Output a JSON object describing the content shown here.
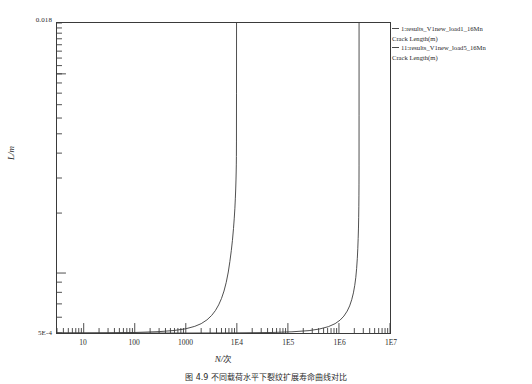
{
  "chart_data": {
    "type": "line",
    "title": "",
    "xlabel": "N/次",
    "ylabel": "L/m",
    "xscale": "log",
    "yscale": "log",
    "xlim": [
      3,
      10000000
    ],
    "ylim": [
      0.0005,
      0.018
    ],
    "grid": false,
    "legend_position": "right",
    "xtick_labels": [
      "10",
      "100",
      "1000",
      "1E4",
      "1E5",
      "1E6",
      "1E7"
    ],
    "xtick_values": [
      10,
      100,
      1000,
      10000,
      100000,
      1000000,
      10000000
    ],
    "ytick_labels": [
      "0.018",
      "5E-4"
    ],
    "ytick_values": [
      0.018,
      0.0005
    ],
    "series": [
      {
        "name": "1:results_V1new_load1_16Mn Crack Length(m)",
        "color": "#3a3a3a",
        "x": [
          3,
          10,
          30,
          100,
          300,
          600,
          1000,
          1500,
          2000,
          2600,
          3200,
          3800,
          4400,
          5000,
          5600,
          6200,
          6800,
          7300,
          7800,
          8200,
          8600,
          8900,
          9150,
          9350,
          9500,
          9620,
          9700,
          9760,
          9800,
          9830,
          9850,
          9860
        ],
        "y": [
          0.0005,
          0.0005,
          0.000501,
          0.000503,
          0.000508,
          0.000515,
          0.000525,
          0.00054,
          0.000557,
          0.000582,
          0.000612,
          0.000648,
          0.000692,
          0.000745,
          0.000812,
          0.000898,
          0.001012,
          0.001142,
          0.0013,
          0.00146,
          0.001672,
          0.001885,
          0.002115,
          0.002375,
          0.002642,
          0.002932,
          0.003215,
          0.003522,
          0.003852,
          0.00455,
          0.008,
          0.018
        ]
      },
      {
        "name": "11:results_V1new_load5_16Mn Crack Length(m)",
        "color": "#3a3a3a",
        "x": [
          3,
          100,
          1000,
          10000,
          50000,
          120000,
          260000,
          420000,
          620000,
          840000,
          1050000,
          1250000,
          1450000,
          1620000,
          1780000,
          1920000,
          2040000,
          2140000,
          2220000,
          2290000,
          2340000,
          2380000,
          2412000,
          2435000,
          2452000,
          2463000,
          2470000,
          2474000,
          2477000,
          2479000
        ],
        "y": [
          0.0005,
          0.0005,
          0.0005,
          0.000501,
          0.000503,
          0.000507,
          0.000514,
          0.000524,
          0.000538,
          0.000557,
          0.00058,
          0.000608,
          0.000644,
          0.000684,
          0.000735,
          0.000795,
          0.000868,
          0.000952,
          0.001055,
          0.001185,
          0.001325,
          0.00149,
          0.001682,
          0.001905,
          0.002165,
          0.00246,
          0.002795,
          0.00345,
          0.0062,
          0.018
        ]
      }
    ]
  },
  "axes": {
    "y_top_label": "0.018",
    "y_bottom_label": "5E-4",
    "y_title": "L/m",
    "x_title_symbol": "N/",
    "x_title_unit": "次"
  },
  "legend": {
    "entries": [
      {
        "label": "1:results_V1new_load1_16Mn",
        "sublabel": "Crack Length(m)",
        "color": "#4a4a4a"
      },
      {
        "label": "11:results_V1new_load5_16Mn",
        "sublabel": "Crack Length(m)",
        "color": "#4a4a4a"
      }
    ]
  },
  "caption": {
    "text": "图 4.9  不同载荷水平下裂纹扩展寿命曲线对比"
  }
}
